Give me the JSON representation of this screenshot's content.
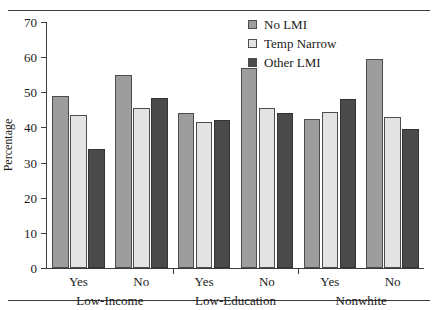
{
  "chart_data": {
    "type": "bar",
    "title": "",
    "xlabel": "",
    "ylabel": "Percentage",
    "ylim": [
      0,
      70
    ],
    "yticks": [
      0,
      10,
      20,
      30,
      40,
      50,
      60,
      70
    ],
    "grid": false,
    "legend_position": "top-right",
    "groups": [
      {
        "name": "Low-Income",
        "categories": [
          "Yes",
          "No"
        ]
      },
      {
        "name": "Low-Education",
        "categories": [
          "Yes",
          "No"
        ]
      },
      {
        "name": "Nonwhite",
        "categories": [
          "Yes",
          "No"
        ]
      }
    ],
    "categories": [
      "Low-Income Yes",
      "Low-Income No",
      "Low-Education Yes",
      "Low-Education No",
      "Nonwhite Yes",
      "Nonwhite No"
    ],
    "series": [
      {
        "name": "No LMI",
        "color": "#9d9d9d",
        "values": [
          49.0,
          55.0,
          44.0,
          57.0,
          42.5,
          59.5
        ]
      },
      {
        "name": "Temp Narrow",
        "color": "#e3e3e3",
        "values": [
          43.5,
          45.5,
          41.5,
          45.5,
          44.5,
          43.0
        ]
      },
      {
        "name": "Other LMI",
        "color": "#4a4a4a",
        "values": [
          34.0,
          48.5,
          42.0,
          44.0,
          48.0,
          39.5
        ]
      }
    ]
  },
  "legend": {
    "items": [
      {
        "label": "No LMI",
        "swatch": "legend-swatch-no-lmi"
      },
      {
        "label": "Temp Narrow",
        "swatch": "legend-swatch-temp-narrow"
      },
      {
        "label": "Other LMI",
        "swatch": "legend-swatch-other-lmi"
      }
    ]
  }
}
